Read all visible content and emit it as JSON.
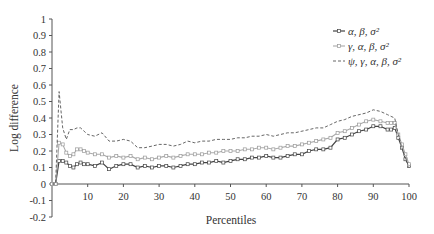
{
  "chart_data": {
    "type": "line",
    "title": "",
    "xlabel": "Percentiles",
    "ylabel": "Log difference",
    "xlim": [
      0,
      100
    ],
    "ylim": [
      -0.2,
      1
    ],
    "xticks": [
      "10",
      "20",
      "30",
      "40",
      "50",
      "60",
      "70",
      "80",
      "90",
      "100"
    ],
    "yticks": [
      "1",
      "0.9",
      "0.8",
      "0.7",
      "0.6",
      "0.5",
      "0.4",
      "0.3",
      "0.2",
      "0.1",
      "0",
      "-0.1",
      "-0.2"
    ],
    "grid": false,
    "legend_position": "upper right",
    "x": [
      0,
      1,
      2,
      3,
      4,
      5,
      6,
      7,
      8,
      9,
      10,
      12,
      14,
      16,
      18,
      20,
      22,
      24,
      26,
      28,
      30,
      32,
      34,
      36,
      38,
      40,
      42,
      44,
      46,
      48,
      50,
      52,
      54,
      56,
      58,
      60,
      62,
      64,
      66,
      68,
      70,
      72,
      74,
      76,
      78,
      80,
      82,
      84,
      86,
      88,
      90,
      92,
      94,
      95,
      96,
      97,
      98,
      99,
      100
    ],
    "series": [
      {
        "name": "α, β, σ²",
        "style": "solid-square-markers",
        "values": [
          0,
          0,
          0.14,
          0.14,
          0.13,
          0.11,
          0.1,
          0.12,
          0.13,
          0.12,
          0.12,
          0.11,
          0.13,
          0.09,
          0.11,
          0.12,
          0.12,
          0.1,
          0.11,
          0.1,
          0.11,
          0.11,
          0.1,
          0.11,
          0.12,
          0.12,
          0.13,
          0.13,
          0.14,
          0.13,
          0.14,
          0.15,
          0.15,
          0.16,
          0.16,
          0.17,
          0.16,
          0.16,
          0.17,
          0.18,
          0.18,
          0.2,
          0.21,
          0.21,
          0.22,
          0.27,
          0.28,
          0.3,
          0.32,
          0.33,
          0.35,
          0.35,
          0.33,
          0.33,
          0.34,
          0.28,
          0.22,
          0.15,
          0.11
        ]
      },
      {
        "name": "γ, α, β, σ²",
        "style": "solid-light-markers",
        "values": [
          0,
          0,
          0.25,
          0.24,
          0.19,
          0.17,
          0.18,
          0.21,
          0.21,
          0.2,
          0.19,
          0.18,
          0.18,
          0.16,
          0.17,
          0.16,
          0.17,
          0.15,
          0.16,
          0.15,
          0.16,
          0.17,
          0.16,
          0.17,
          0.18,
          0.18,
          0.18,
          0.19,
          0.19,
          0.2,
          0.2,
          0.2,
          0.21,
          0.21,
          0.22,
          0.22,
          0.21,
          0.22,
          0.23,
          0.23,
          0.24,
          0.25,
          0.26,
          0.27,
          0.28,
          0.31,
          0.32,
          0.34,
          0.36,
          0.38,
          0.39,
          0.38,
          0.37,
          0.37,
          0.37,
          0.3,
          0.24,
          0.18,
          0.12
        ]
      },
      {
        "name": "ψ, γ, α, β, σ²",
        "style": "dashed",
        "values": [
          0,
          0,
          0.56,
          0.34,
          0.27,
          0.33,
          0.33,
          0.34,
          0.34,
          0.32,
          0.3,
          0.29,
          0.31,
          0.26,
          0.26,
          0.27,
          0.26,
          0.22,
          0.22,
          0.23,
          0.24,
          0.24,
          0.23,
          0.24,
          0.26,
          0.25,
          0.26,
          0.26,
          0.27,
          0.27,
          0.27,
          0.28,
          0.28,
          0.29,
          0.29,
          0.3,
          0.29,
          0.3,
          0.31,
          0.31,
          0.32,
          0.33,
          0.34,
          0.34,
          0.36,
          0.38,
          0.39,
          0.41,
          0.42,
          0.43,
          0.45,
          0.44,
          0.42,
          0.41,
          0.4,
          0.3,
          0.22,
          0.16,
          0.1
        ]
      }
    ]
  }
}
